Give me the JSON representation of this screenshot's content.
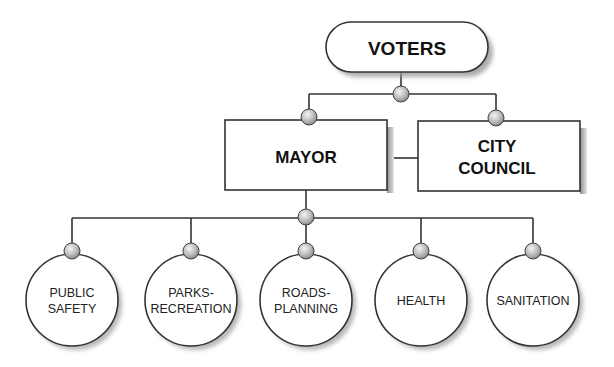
{
  "diagram": {
    "type": "org-chart",
    "colors": {
      "line": "#333333",
      "shadow": "#9a9a9a",
      "knob": "#c8c8c8",
      "node_fill": "#ffffff"
    },
    "top": {
      "id": "voters",
      "label": "VOTERS"
    },
    "executive": {
      "id": "mayor",
      "label": "MAYOR"
    },
    "legislative": {
      "id": "city-council",
      "line1": "CITY",
      "line2": "COUNCIL"
    },
    "departments": [
      {
        "id": "public-safety",
        "line1": "PUBLIC",
        "line2": "SAFETY"
      },
      {
        "id": "parks-recreation",
        "line1": "PARKS-",
        "line2": "RECREATION"
      },
      {
        "id": "roads-planning",
        "line1": "ROADS-",
        "line2": "PLANNING"
      },
      {
        "id": "health",
        "line1": "HEALTH",
        "line2": ""
      },
      {
        "id": "sanitation",
        "line1": "SANITATION",
        "line2": ""
      }
    ],
    "edges": [
      [
        "voters",
        "mayor"
      ],
      [
        "voters",
        "city-council"
      ],
      [
        "mayor",
        "city-council"
      ],
      [
        "mayor",
        "public-safety"
      ],
      [
        "mayor",
        "parks-recreation"
      ],
      [
        "mayor",
        "roads-planning"
      ],
      [
        "mayor",
        "health"
      ],
      [
        "mayor",
        "sanitation"
      ]
    ]
  }
}
